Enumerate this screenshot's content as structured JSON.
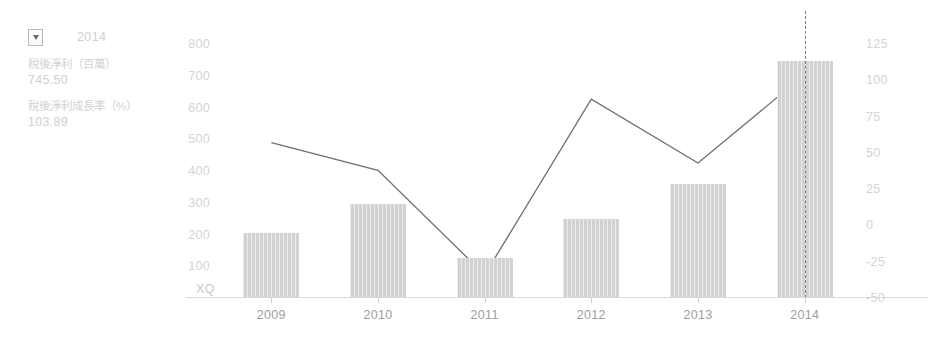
{
  "panel": {
    "dropdown_icon": "chevron-down-icon",
    "selected_year": "2014",
    "metrics": [
      {
        "name": "稅後淨利（百萬）",
        "value": "745.50"
      },
      {
        "name": "稅後淨利成長率（%）",
        "value": "103.89"
      }
    ]
  },
  "watermark": "XQ",
  "chart_data": {
    "type": "bar",
    "title": "",
    "xlabel": "",
    "categories": [
      "2009",
      "2010",
      "2011",
      "2012",
      "2013",
      "2014"
    ],
    "grid": false,
    "legend_position": "left-panel",
    "series": [
      {
        "name": "稅後淨利（百萬）",
        "type": "bar",
        "axis": "left",
        "color": "#d2d2d2",
        "values": [
          205,
          295,
          125,
          250,
          360,
          745.5
        ]
      },
      {
        "name": "稅後淨利成長率（%）",
        "type": "line",
        "axis": "right",
        "color": "#6f6f6f",
        "values": [
          57,
          38,
          -34,
          87,
          43,
          103.89
        ]
      }
    ],
    "left_axis": {
      "label": "",
      "ticks": [
        "800",
        "700",
        "600",
        "500",
        "400",
        "300",
        "200",
        "100"
      ],
      "ylim": [
        0,
        800
      ]
    },
    "right_axis": {
      "label": "",
      "ticks": [
        "125",
        "100",
        "75",
        "50",
        "25",
        "0",
        "-25",
        "-50"
      ],
      "ylim": [
        -50,
        125
      ]
    },
    "annotations": [
      {
        "type": "vertical-dashed-cursor",
        "at": "2014"
      }
    ]
  }
}
